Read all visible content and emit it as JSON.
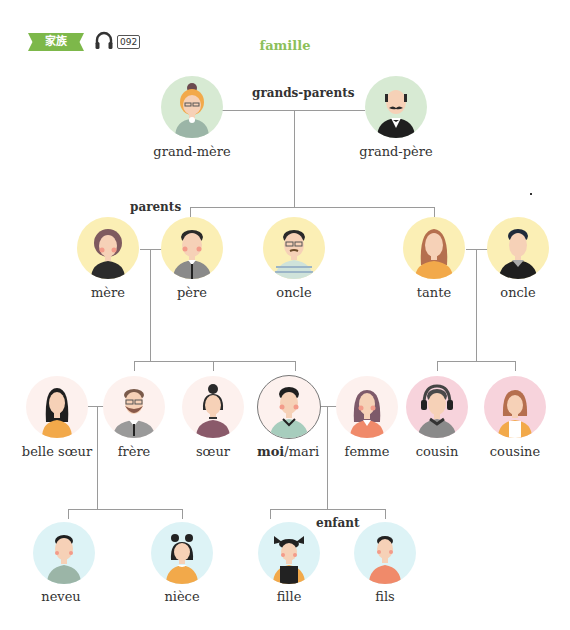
{
  "header": {
    "badge": "家族",
    "track_number": "092",
    "title": "famille"
  },
  "groups": {
    "grandparents": "grands-parents",
    "parents": "parents",
    "child": "enfant"
  },
  "members": {
    "grandmother": {
      "label": "grand-mère",
      "bg": "#d7ead3"
    },
    "grandfather": {
      "label": "grand-père",
      "bg": "#d7ead3"
    },
    "mother": {
      "label": "mère",
      "bg": "#fbefb5"
    },
    "father": {
      "label": "père",
      "bg": "#fbefb5"
    },
    "uncle1": {
      "label": "oncle",
      "bg": "#fbefb5"
    },
    "aunt": {
      "label": "tante",
      "bg": "#fbefb5"
    },
    "uncle2": {
      "label": "oncle",
      "bg": "#fbefb5"
    },
    "sister_in_law": {
      "label": "belle sœur",
      "bg": "#fdf1ee"
    },
    "brother": {
      "label": "frère",
      "bg": "#fdf1ee"
    },
    "sister": {
      "label": "sœur",
      "bg": "#fdf1ee"
    },
    "me": {
      "label_bold": "moi",
      "label_rest": "/mari",
      "bg": "#fdf1ee"
    },
    "wife": {
      "label": "femme",
      "bg": "#fdf1ee"
    },
    "cousin_m": {
      "label": "cousin",
      "bg": "#f7d3dc"
    },
    "cousin_f": {
      "label": "cousine",
      "bg": "#f7d3dc"
    },
    "nephew": {
      "label": "neveu",
      "bg": "#ddf3f6"
    },
    "niece": {
      "label": "nièce",
      "bg": "#ddf3f6"
    },
    "daughter": {
      "label": "fille",
      "bg": "#ddf3f6"
    },
    "son": {
      "label": "fils",
      "bg": "#ddf3f6"
    }
  },
  "colors": {
    "accent": "#7db84a",
    "title": "#8cbf5a",
    "connector": "#9a9a9a"
  }
}
